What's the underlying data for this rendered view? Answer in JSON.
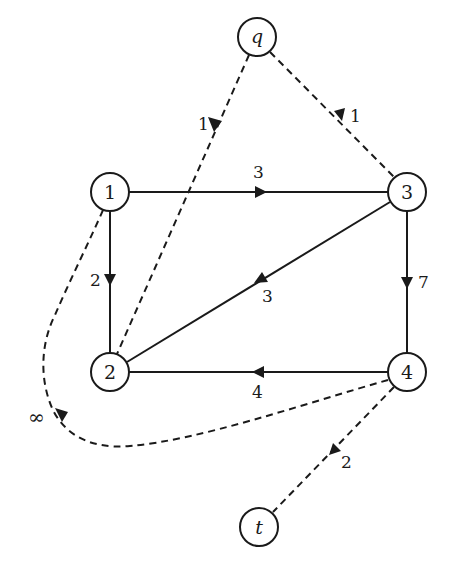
{
  "diagram": {
    "type": "directed-graph",
    "nodes": [
      {
        "id": "q",
        "label": "q",
        "italic": true
      },
      {
        "id": "1",
        "label": "1",
        "italic": false
      },
      {
        "id": "3",
        "label": "3",
        "italic": false
      },
      {
        "id": "2",
        "label": "2",
        "italic": false
      },
      {
        "id": "4",
        "label": "4",
        "italic": false
      },
      {
        "id": "t",
        "label": "t",
        "italic": true
      }
    ],
    "edges": [
      {
        "from": "q",
        "to": "2",
        "weight": "1",
        "style": "dashed"
      },
      {
        "from": "q",
        "to": "3",
        "weight": "1",
        "style": "dashed"
      },
      {
        "from": "1",
        "to": "3",
        "weight": "3",
        "style": "solid"
      },
      {
        "from": "1",
        "to": "2",
        "weight": "2",
        "style": "solid"
      },
      {
        "from": "3",
        "to": "2",
        "weight": "3",
        "style": "solid"
      },
      {
        "from": "3",
        "to": "4",
        "weight": "7",
        "style": "solid"
      },
      {
        "from": "4",
        "to": "2",
        "weight": "4",
        "style": "solid"
      },
      {
        "from": "4",
        "to": "1",
        "weight": "∞",
        "style": "dashed"
      },
      {
        "from": "4",
        "to": "t",
        "weight": "2",
        "style": "dashed"
      }
    ]
  }
}
